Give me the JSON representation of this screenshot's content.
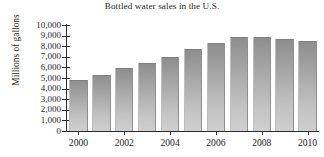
{
  "chart_data": {
    "type": "bar",
    "title": "Bottled water sales in the U.S.",
    "xlabel": "",
    "ylabel": "Millions of gallons",
    "categories": [
      "2000",
      "2001",
      "2002",
      "2003",
      "2004",
      "2005",
      "2006",
      "2007",
      "2008",
      "2009",
      "2010"
    ],
    "values": [
      4800,
      5250,
      5900,
      6400,
      7000,
      7700,
      8350,
      8900,
      8900,
      8650,
      8450
    ],
    "x_tick_labels": [
      "2000",
      "2002",
      "2004",
      "2006",
      "2008",
      "2010"
    ],
    "y_tick_labels": [
      "10,000",
      "9,000",
      "8,000",
      "7,000",
      "6,000",
      "5,000",
      "4,000",
      "3,000",
      "2,000",
      "1,000",
      "0"
    ],
    "y_tick_values": [
      10000,
      9000,
      8000,
      7000,
      6000,
      5000,
      4000,
      3000,
      2000,
      1000,
      0
    ],
    "ylim": [
      0,
      10000
    ],
    "grid": false,
    "legend": "none",
    "bar_color_top": "#8d8d8d",
    "bar_color_bottom": "#cfcfcf",
    "axis_color": "#2b2b2b",
    "background": "#ffffff"
  }
}
